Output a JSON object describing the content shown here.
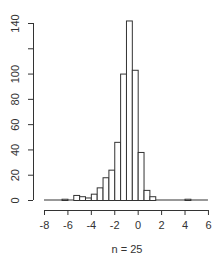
{
  "chart_data": {
    "type": "bar",
    "title": "",
    "xlabel": "n = 25",
    "ylabel": "",
    "bin_width": 0.5,
    "bins": [
      {
        "start": -8.0,
        "count": 0
      },
      {
        "start": -7.5,
        "count": 0
      },
      {
        "start": -7.0,
        "count": 0
      },
      {
        "start": -6.5,
        "count": 1
      },
      {
        "start": -6.0,
        "count": 0
      },
      {
        "start": -5.5,
        "count": 4
      },
      {
        "start": -5.0,
        "count": 3
      },
      {
        "start": -4.5,
        "count": 2
      },
      {
        "start": -4.0,
        "count": 5
      },
      {
        "start": -3.5,
        "count": 10
      },
      {
        "start": -3.0,
        "count": 18
      },
      {
        "start": -2.5,
        "count": 24
      },
      {
        "start": -2.0,
        "count": 46
      },
      {
        "start": -1.5,
        "count": 100
      },
      {
        "start": -1.0,
        "count": 142
      },
      {
        "start": -0.5,
        "count": 103
      },
      {
        "start": 0.0,
        "count": 38
      },
      {
        "start": 0.5,
        "count": 8
      },
      {
        "start": 1.0,
        "count": 3
      },
      {
        "start": 1.5,
        "count": 0
      },
      {
        "start": 2.0,
        "count": 0
      },
      {
        "start": 2.5,
        "count": 0
      },
      {
        "start": 3.0,
        "count": 0
      },
      {
        "start": 3.5,
        "count": 0
      },
      {
        "start": 4.0,
        "count": 1
      },
      {
        "start": 4.5,
        "count": 0
      },
      {
        "start": 5.0,
        "count": 0
      },
      {
        "start": 5.5,
        "count": 0
      }
    ],
    "xlim": [
      -8,
      6
    ],
    "ylim": [
      0,
      140
    ],
    "x_ticks": [
      -8,
      -6,
      -4,
      -2,
      0,
      2,
      4,
      6
    ],
    "y_ticks": [
      0,
      20,
      40,
      60,
      80,
      100,
      120,
      140
    ],
    "y_tick_labels_shown": [
      "0",
      "20",
      "40",
      "60",
      "80",
      "100",
      "140"
    ],
    "grid": false,
    "legend": null,
    "bar_fill": "#ffffff",
    "bar_stroke": "#333333"
  }
}
